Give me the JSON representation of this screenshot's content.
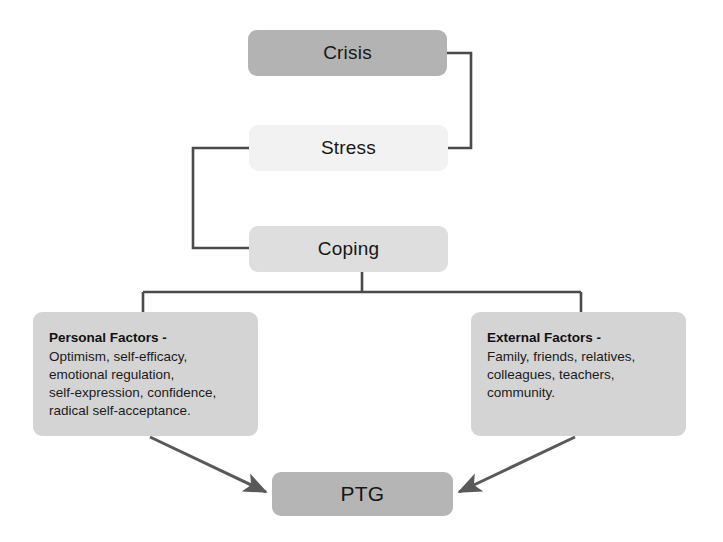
{
  "diagram": {
    "colors": {
      "connector": "#4a4a4a",
      "arrow": "#595959",
      "crisis_fill": "#b3b3b3",
      "stress_fill": "#f2f2f2",
      "coping_fill": "#dedede",
      "factor_fill": "#d4d4d4",
      "ptg_fill": "#b5b5b5",
      "text": "#171717",
      "background": "#ffffff"
    },
    "nodes": {
      "crisis": {
        "label": "Crisis"
      },
      "stress": {
        "label": "Stress"
      },
      "coping": {
        "label": "Coping"
      },
      "personal_factors": {
        "heading": "Personal Factors -",
        "lines": [
          "Optimism, self-efficacy,",
          "emotional regulation,",
          "self-expression, confidence,",
          "radical self-acceptance."
        ]
      },
      "external_factors": {
        "heading": "External Factors -",
        "lines": [
          "Family, friends, relatives,",
          "colleagues, teachers,",
          "community."
        ]
      },
      "ptg": {
        "label": "PTG"
      }
    },
    "footer_caption": ""
  }
}
